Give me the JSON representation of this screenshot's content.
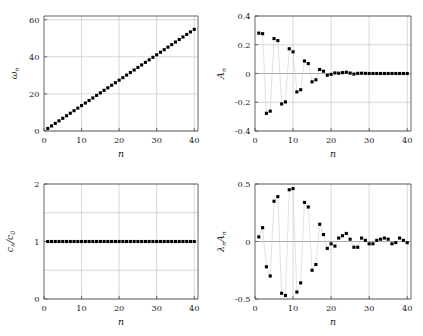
{
  "figure": {
    "background": "#ffffff",
    "marker_color": "#000000",
    "grid_color": "#bdbdbd",
    "axis_color": "#555555",
    "panel_count": 4
  },
  "chart_data": [
    {
      "type": "scatter",
      "panel": "top-left",
      "title": "",
      "xlabel": "n",
      "ylabel": "ωₙ",
      "xlim": [
        0,
        41
      ],
      "ylim": [
        0,
        62
      ],
      "xticks": [
        0,
        10,
        20,
        30,
        40
      ],
      "yticks": [
        0,
        20,
        40,
        60
      ],
      "xticklabels": [
        "0",
        "10",
        "20",
        "30",
        "40"
      ],
      "yticklabels": [
        "0",
        "20",
        "40",
        "60"
      ],
      "grid": true,
      "legend": "none",
      "connected": false,
      "x": [
        1,
        2,
        3,
        4,
        5,
        6,
        7,
        8,
        9,
        10,
        11,
        12,
        13,
        14,
        15,
        16,
        17,
        18,
        19,
        20,
        21,
        22,
        23,
        24,
        25,
        26,
        27,
        28,
        29,
        30,
        31,
        32,
        33,
        34,
        35,
        36,
        37,
        38,
        39,
        40
      ],
      "values": [
        1.37,
        2.74,
        4.11,
        5.48,
        6.85,
        8.22,
        9.59,
        10.96,
        12.33,
        13.7,
        15.07,
        16.44,
        17.81,
        19.18,
        20.55,
        21.92,
        23.29,
        24.66,
        26.03,
        27.4,
        28.77,
        30.14,
        31.51,
        32.88,
        34.25,
        35.62,
        36.99,
        38.36,
        39.73,
        41.1,
        42.47,
        43.84,
        45.21,
        46.58,
        47.95,
        49.32,
        50.69,
        52.06,
        53.43,
        54.8
      ]
    },
    {
      "type": "scatter",
      "panel": "top-right",
      "title": "",
      "xlabel": "n",
      "ylabel": "Aₙ",
      "xlim": [
        0,
        41
      ],
      "ylim": [
        -0.4,
        0.4
      ],
      "xticks": [
        0,
        10,
        20,
        30,
        40
      ],
      "yticks": [
        -0.4,
        -0.2,
        0,
        0.2,
        0.4
      ],
      "xticklabels": [
        "0",
        "10",
        "20",
        "30",
        "40"
      ],
      "yticklabels": [
        "-0.4",
        "-0.2",
        "0",
        "0.2",
        "0.4"
      ],
      "grid": true,
      "legend": "none",
      "connected": true,
      "x": [
        1,
        2,
        3,
        4,
        5,
        6,
        7,
        8,
        9,
        10,
        11,
        12,
        13,
        14,
        15,
        16,
        17,
        18,
        19,
        20,
        21,
        22,
        23,
        24,
        25,
        26,
        27,
        28,
        29,
        30,
        31,
        32,
        33,
        34,
        35,
        36,
        37,
        38,
        39,
        40
      ],
      "values": [
        0.281,
        0.277,
        -0.277,
        -0.262,
        0.243,
        0.229,
        -0.212,
        -0.198,
        0.172,
        0.151,
        -0.128,
        -0.113,
        0.087,
        0.069,
        -0.058,
        -0.044,
        0.028,
        0.016,
        -0.012,
        -0.006,
        0.004,
        0.002,
        0.006,
        0.009,
        0.003,
        -0.004,
        0.001,
        0.002,
        0.001,
        0.0,
        0.0,
        0.0,
        0.0,
        0.0,
        0.0,
        0.0,
        0.0,
        0.0,
        0.0,
        0.0
      ]
    },
    {
      "type": "scatter",
      "panel": "bottom-left",
      "title": "",
      "xlabel": "n",
      "ylabel": "cₙ/c₀",
      "xlim": [
        0,
        41
      ],
      "ylim": [
        0,
        2
      ],
      "xticks": [
        0,
        10,
        20,
        30,
        40
      ],
      "yticks": [
        0,
        1,
        2
      ],
      "xticklabels": [
        "0",
        "10",
        "20",
        "30",
        "40"
      ],
      "yticklabels": [
        "0",
        "1",
        "2"
      ],
      "gridlines_minor": [
        0.5,
        1.5
      ],
      "grid": true,
      "legend": "none",
      "connected": false,
      "x": [
        1,
        2,
        3,
        4,
        5,
        6,
        7,
        8,
        9,
        10,
        11,
        12,
        13,
        14,
        15,
        16,
        17,
        18,
        19,
        20,
        21,
        22,
        23,
        24,
        25,
        26,
        27,
        28,
        29,
        30,
        31,
        32,
        33,
        34,
        35,
        36,
        37,
        38,
        39,
        40
      ],
      "values": [
        1,
        1,
        1,
        1,
        1,
        1,
        1,
        1,
        1,
        1,
        1,
        1,
        1,
        1,
        1,
        1,
        1,
        1,
        1,
        1,
        1,
        1,
        1,
        1,
        1,
        1,
        1,
        1,
        1,
        1,
        1,
        1,
        1,
        1,
        1,
        1,
        1,
        1,
        1,
        1
      ]
    },
    {
      "type": "scatter",
      "panel": "bottom-right",
      "title": "",
      "xlabel": "n",
      "ylabel": "λₙAₙ",
      "xlim": [
        0,
        41
      ],
      "ylim": [
        -0.5,
        0.5
      ],
      "xticks": [
        0,
        10,
        20,
        30,
        40
      ],
      "yticks": [
        -0.5,
        0,
        0.5
      ],
      "xticklabels": [
        "0",
        "10",
        "20",
        "30",
        "40"
      ],
      "yticklabels": [
        "-0.5",
        "0",
        "0.5"
      ],
      "grid": true,
      "legend": "none",
      "connected": true,
      "x": [
        1,
        2,
        3,
        4,
        5,
        6,
        7,
        8,
        9,
        10,
        11,
        12,
        13,
        14,
        15,
        16,
        17,
        18,
        19,
        20,
        21,
        22,
        23,
        24,
        25,
        26,
        27,
        28,
        29,
        30,
        31,
        32,
        33,
        34,
        35,
        36,
        37,
        38,
        39,
        40
      ],
      "values": [
        0.04,
        0.12,
        -0.22,
        -0.3,
        0.35,
        0.39,
        -0.45,
        -0.47,
        0.45,
        0.46,
        -0.44,
        -0.36,
        0.34,
        0.3,
        -0.25,
        -0.2,
        0.15,
        0.06,
        -0.06,
        -0.02,
        -0.04,
        0.03,
        0.05,
        0.07,
        0.02,
        -0.05,
        -0.05,
        0.03,
        0.01,
        -0.02,
        -0.02,
        0.01,
        0.02,
        0.03,
        0.02,
        -0.02,
        -0.01,
        0.03,
        0.01,
        -0.01
      ]
    }
  ]
}
